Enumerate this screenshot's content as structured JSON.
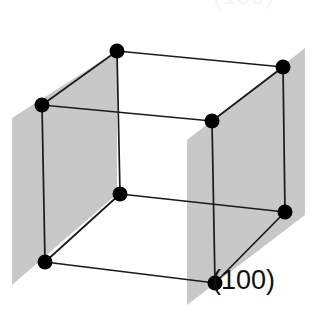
{
  "figure": {
    "name": "crystallographic-plane-diagram",
    "width": 323,
    "height": 322,
    "background_color": "#FFFFFF"
  },
  "labels": {
    "miller_index": "(100)",
    "miller_index_x": 212,
    "miller_index_y": 289,
    "cropped_top_text": "(100)"
  },
  "colors": {
    "plane_fill": "#C8C8C8",
    "edge_stroke": "#1A1A1A",
    "vertex_fill": "#000000",
    "label_text": "#111111",
    "background": "#FFFFFF"
  },
  "geometry": {
    "vertex_radius": 7.5,
    "edge_width": 1.7,
    "vertices": [
      {
        "id": "top-back-left",
        "x": 117,
        "y": 51
      },
      {
        "id": "top-back-right",
        "x": 283,
        "y": 67
      },
      {
        "id": "top-front-left",
        "x": 42,
        "y": 105
      },
      {
        "id": "top-front-right",
        "x": 212,
        "y": 121
      },
      {
        "id": "bottom-back-left",
        "x": 120,
        "y": 194
      },
      {
        "id": "bottom-back-right",
        "x": 285,
        "y": 212
      },
      {
        "id": "bottom-front-left",
        "x": 45,
        "y": 262
      },
      {
        "id": "bottom-front-right",
        "x": 215,
        "y": 283
      }
    ],
    "edges": [
      {
        "from": "top-back-left",
        "to": "top-back-right"
      },
      {
        "from": "top-back-left",
        "to": "top-front-left"
      },
      {
        "from": "top-back-right",
        "to": "top-front-right"
      },
      {
        "from": "top-front-left",
        "to": "top-front-right"
      },
      {
        "from": "bottom-back-left",
        "to": "bottom-back-right"
      },
      {
        "from": "bottom-back-left",
        "to": "bottom-front-left"
      },
      {
        "from": "bottom-back-right",
        "to": "bottom-front-right"
      },
      {
        "from": "bottom-front-left",
        "to": "bottom-front-right"
      },
      {
        "from": "top-back-left",
        "to": "bottom-back-left"
      },
      {
        "from": "top-back-right",
        "to": "bottom-back-right"
      },
      {
        "from": "top-front-left",
        "to": "bottom-front-left"
      },
      {
        "from": "top-front-right",
        "to": "bottom-front-right"
      }
    ],
    "planes": [
      {
        "id": "left-plane",
        "label": "(100) left face plane",
        "points": "12,118 117,51 117,194 12,285"
      },
      {
        "id": "right-plane",
        "label": "(100) right face plane",
        "points": "187,140 305,48 305,215 187,305"
      }
    ]
  }
}
